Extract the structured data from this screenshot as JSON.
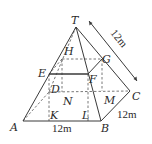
{
  "figure": {
    "type": "pyramid-with-inscribed-prism",
    "vertices": {
      "T": "T",
      "A": "A",
      "B": "B",
      "C": "C",
      "D": "D",
      "E": "E",
      "F": "F",
      "G": "G",
      "H": "H",
      "K": "K",
      "L": "L",
      "M": "M",
      "N": "N"
    },
    "dimensions": {
      "AB": "12m",
      "BC": "12m",
      "TC": "12m"
    }
  }
}
